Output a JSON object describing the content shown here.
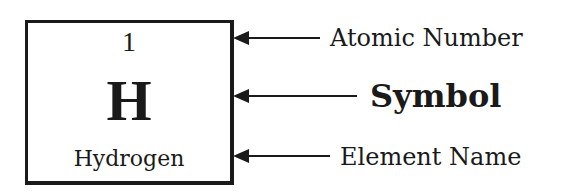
{
  "element": {
    "atomic_number": "1",
    "symbol": "H",
    "name": "Hydrogen"
  },
  "labels": {
    "atomic_number": "Atomic Number",
    "symbol": "Symbol",
    "element_name": "Element Name"
  },
  "colors": {
    "ink": "#1a1a1a",
    "background": "#ffffff"
  }
}
